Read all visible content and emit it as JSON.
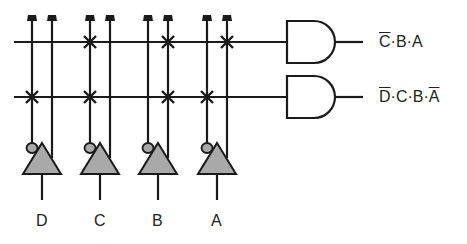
{
  "diagram": {
    "type": "decoder-and-array",
    "inputs": [
      {
        "name": "D",
        "label": "D",
        "x_inverted": 32,
        "x_true": 52,
        "buffer_x": 42
      },
      {
        "name": "C",
        "label": "C",
        "x_inverted": 90,
        "x_true": 110,
        "buffer_x": 100
      },
      {
        "name": "B",
        "label": "B",
        "x_inverted": 148,
        "x_true": 168,
        "buffer_x": 158
      },
      {
        "name": "A",
        "label": "A",
        "x_inverted": 207,
        "x_true": 227,
        "buffer_x": 217
      }
    ],
    "rows": [
      {
        "y": 42,
        "cross_x": [
          90,
          168,
          227
        ],
        "output_label_parts": [
          {
            "t": "C",
            "bar": true
          },
          {
            "t": "·B·A",
            "bar": false
          }
        ]
      },
      {
        "y": 97,
        "cross_x": [
          32,
          90,
          168,
          207
        ],
        "output_label_parts": [
          {
            "t": "D",
            "bar": true
          },
          {
            "t": "·C·B·",
            "bar": false
          },
          {
            "t": "A",
            "bar": true
          }
        ]
      }
    ],
    "outputs": {
      "row1": "C̄·B·A",
      "row2": "D̄·C·B·Ā"
    },
    "labels": {
      "D": "D",
      "C": "C",
      "B": "B",
      "A": "A"
    },
    "colors": {
      "line": "#1a1a1a",
      "buffer_fill": "#a9a9a9"
    }
  }
}
